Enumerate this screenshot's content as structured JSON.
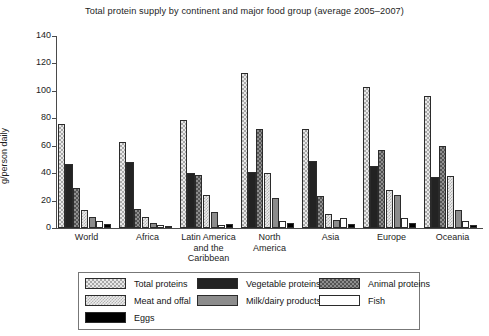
{
  "chart_data": {
    "type": "bar",
    "title": "Total protein supply by continent and major food group (average 2005–2007)",
    "xlabel": "",
    "ylabel": "g/person daily",
    "ylim": [
      0,
      140
    ],
    "yticks": [
      0,
      20,
      40,
      60,
      80,
      100,
      120,
      140
    ],
    "grid": false,
    "legend_position": "bottom",
    "categories": [
      "World",
      "Africa",
      "Latin America\nand the\nCaribbean",
      "North\nAmerica",
      "Asia",
      "Europe",
      "Oceania"
    ],
    "series": [
      {
        "name": "Total proteins",
        "pattern": "light-checker",
        "values": [
          76,
          63,
          79,
          113,
          72,
          103,
          96
        ]
      },
      {
        "name": "Vegetable proteins",
        "pattern": "solid-dark",
        "values": [
          47,
          48,
          40,
          41,
          49,
          45,
          37
        ]
      },
      {
        "name": "Animal proteins",
        "pattern": "gray-checker",
        "values": [
          29,
          14,
          39,
          72,
          23,
          57,
          60
        ]
      },
      {
        "name": "Meat and offal",
        "pattern": "pale-checker",
        "values": [
          13,
          8,
          24,
          40,
          10,
          28,
          38
        ]
      },
      {
        "name": "Milk/dairy products",
        "pattern": "solid-gray",
        "values": [
          8,
          4,
          12,
          22,
          6,
          24,
          13
        ]
      },
      {
        "name": "Fish",
        "pattern": "white",
        "values": [
          5,
          2,
          2,
          5,
          7,
          7,
          5
        ]
      },
      {
        "name": "Eggs",
        "pattern": "solid-black",
        "values": [
          3,
          1,
          3,
          4,
          3,
          4,
          2
        ]
      }
    ]
  },
  "legend": {
    "entries": [
      {
        "label": "Total proteins",
        "swatch": "p-total"
      },
      {
        "label": "Vegetable proteins",
        "swatch": "p-veg"
      },
      {
        "label": "Animal proteins",
        "swatch": "p-animal"
      },
      {
        "label": "Meat and offal",
        "swatch": "p-meat"
      },
      {
        "label": "Milk/dairy products",
        "swatch": "p-milk"
      },
      {
        "label": "Fish",
        "swatch": "p-fish"
      },
      {
        "label": "Eggs",
        "swatch": "p-eggs"
      }
    ]
  }
}
